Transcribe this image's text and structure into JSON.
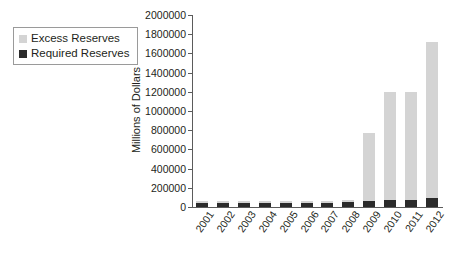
{
  "chart_data": {
    "type": "bar",
    "subtype": "stacked-column",
    "title": "",
    "xlabel": "",
    "ylabel": "Millions of Dollars",
    "ylim": [
      0,
      2000000
    ],
    "ytick_step": 200000,
    "yticks": [
      0,
      200000,
      400000,
      600000,
      800000,
      1000000,
      1200000,
      1400000,
      1600000,
      1800000,
      2000000
    ],
    "ytick_labels": [
      "0",
      "200000",
      "400000",
      "600000",
      "800000",
      "1000000",
      "1200000",
      "1400000",
      "1600000",
      "1800000",
      "2000000"
    ],
    "grid": false,
    "legend_position": "top-left-outside",
    "categories": [
      "2001",
      "2002",
      "2003",
      "2004",
      "2005",
      "2006",
      "2007",
      "2008",
      "2009",
      "2010",
      "2011",
      "2012"
    ],
    "series": [
      {
        "name": "Required Reserves",
        "color": "#2b2b2b",
        "values": [
          40000,
          42000,
          43000,
          44000,
          45000,
          45000,
          43000,
          50000,
          60000,
          68000,
          78000,
          95000
        ]
      },
      {
        "name": "Excess Reserves",
        "color": "#d4d4d4",
        "values": [
          18000,
          20000,
          22000,
          20000,
          20000,
          20000,
          18000,
          22000,
          710000,
          1132000,
          1122000,
          1625000
        ]
      }
    ],
    "totals": [
      58000,
      62000,
      65000,
      64000,
      65000,
      65000,
      61000,
      72000,
      770000,
      1200000,
      1200000,
      1720000
    ]
  },
  "legend": {
    "items": [
      {
        "label": "Excess Reserves",
        "color": "#d4d4d4"
      },
      {
        "label": "Required Reserves",
        "color": "#2b2b2b"
      }
    ]
  },
  "axes": {
    "y_title": "Millions of Dollars"
  }
}
